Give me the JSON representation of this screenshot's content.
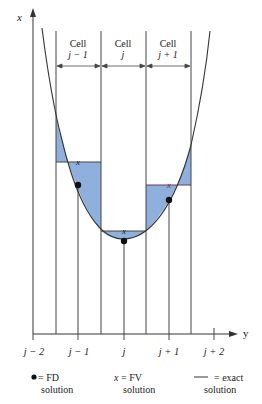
{
  "figure": {
    "axes": {
      "vertical_label": "x",
      "horizontal_label": "y"
    },
    "cells": [
      {
        "title": "Cell",
        "index": "j − 1"
      },
      {
        "title": "Cell",
        "index": "j"
      },
      {
        "title": "Cell",
        "index": "j + 1"
      }
    ],
    "ticks": [
      "j − 2",
      "j − 1",
      "j",
      "j + 1",
      "j + 2"
    ],
    "legend": [
      {
        "symbol": "●",
        "text": "= FD",
        "sub": "solution"
      },
      {
        "symbol": "x",
        "text": "= FV",
        "sub": "solution"
      },
      {
        "symbol": "——",
        "text": "= exact",
        "sub": "solution"
      }
    ],
    "colors": {
      "fill": "#8fb0dc",
      "line": "#333333",
      "fv_mark": "#7a2a4a"
    }
  }
}
